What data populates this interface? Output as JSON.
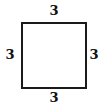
{
  "figure": {
    "shape": "square",
    "stroke_color": "#1a1a1a",
    "side_labels": {
      "top": "3",
      "left": "3",
      "right": "3",
      "bottom": "3"
    }
  }
}
